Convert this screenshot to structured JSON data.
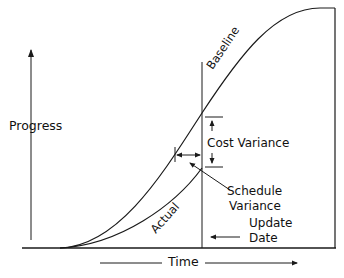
{
  "diagram": {
    "labels": {
      "y_axis": "Progress",
      "x_axis": "Time",
      "baseline_curve": "Baseline",
      "actual_curve": "Actual",
      "cost_variance": "Cost Variance",
      "schedule_variance_line1": "Schedule",
      "schedule_variance_line2": "Variance",
      "update_date_line1": "Update",
      "update_date_line2": "Date"
    },
    "colors": {
      "line": "#1a1a1a",
      "text": "#111111",
      "background": "#ffffff"
    },
    "icons": {
      "progress_arrow": "arrow-up",
      "time_arrow": "arrow-right",
      "update_date_arrow": "arrow-left",
      "cost_variance_arrows": "arrows-vertical-inward",
      "schedule_variance_arrow": "arrow-horizontal-double"
    }
  }
}
